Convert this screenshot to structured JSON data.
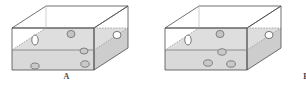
{
  "figure": {
    "type": "scientific-diagram",
    "background_color": "#ffffff",
    "line_color": "#4d4d4d",
    "water_fill_color": "#d9d9d9",
    "water_surface_color": "#cfcfcf",
    "bubble_fill_color": "#c4c4c4",
    "bubble_stroke_color": "#6b6b6b"
  },
  "panels": [
    {
      "id": "A",
      "label": "A",
      "tank": {
        "name": "rectangular-tank",
        "projection": "oblique",
        "water_level_fraction": 0.5
      },
      "bubbles": [
        {
          "id": "a1",
          "location": "front-wall-left-above-water",
          "cx": 35,
          "cy": 40,
          "rx": 3.2,
          "ry": 5.0,
          "filled": false
        },
        {
          "id": "a2",
          "location": "back-wall-above-water",
          "cx": 71,
          "cy": 34,
          "rx": 4.0,
          "ry": 3.6,
          "filled": true
        },
        {
          "id": "a3",
          "location": "right-face-above-water",
          "cx": 117,
          "cy": 35,
          "rx": 4.0,
          "ry": 3.6,
          "filled": false
        },
        {
          "id": "a4",
          "location": "submerged-upper",
          "cx": 84,
          "cy": 51,
          "rx": 4.0,
          "ry": 3.0,
          "filled": true
        },
        {
          "id": "a5",
          "location": "submerged-lower",
          "cx": 85,
          "cy": 64,
          "rx": 4.2,
          "ry": 3.2,
          "filled": true
        },
        {
          "id": "a6",
          "location": "submerged-floor-left",
          "cx": 35,
          "cy": 66,
          "rx": 4.2,
          "ry": 3.0,
          "filled": true
        }
      ],
      "bubble_count": 6,
      "pattern": "bubbles aligned in a vertical column near the centre with one isolated bubble at the lower left"
    },
    {
      "id": "B",
      "label": "B",
      "tank": {
        "name": "rectangular-tank",
        "projection": "oblique",
        "water_level_fraction": 0.5
      },
      "bubbles": [
        {
          "id": "b1",
          "location": "front-wall-left-above-water",
          "cx": 188,
          "cy": 40,
          "rx": 3.2,
          "ry": 5.0,
          "filled": false
        },
        {
          "id": "b2",
          "location": "back-wall-above-water",
          "cx": 220,
          "cy": 34,
          "rx": 4.0,
          "ry": 3.6,
          "filled": true
        },
        {
          "id": "b3",
          "location": "right-face-above-water",
          "cx": 269,
          "cy": 35,
          "rx": 4.0,
          "ry": 3.6,
          "filled": false
        },
        {
          "id": "b4",
          "location": "submerged-upper-centre",
          "cx": 222,
          "cy": 52,
          "rx": 4.2,
          "ry": 3.2,
          "filled": true
        },
        {
          "id": "b5",
          "location": "submerged-floor-left",
          "cx": 208,
          "cy": 63,
          "rx": 4.4,
          "ry": 3.2,
          "filled": true
        },
        {
          "id": "b6",
          "location": "submerged-floor-right",
          "cx": 231,
          "cy": 64,
          "rx": 4.4,
          "ry": 3.2,
          "filled": true
        }
      ],
      "bubble_count": 6,
      "pattern": "bubbles scattered in a loose triangular cluster on the tank floor"
    }
  ]
}
